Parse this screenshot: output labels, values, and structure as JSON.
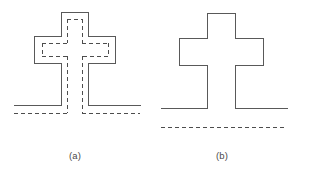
{
  "figure": {
    "background_color": "#ffffff",
    "solid_stroke_color": "#595959",
    "dashed_stroke_color": "#4d4d4d",
    "stroke_width": 1,
    "dash_pattern": "4 3",
    "width": 310,
    "height": 180
  },
  "panels": [
    {
      "id": "a",
      "caption": "(a)",
      "description": "Cross-shaped part outline with inner dashed offset contour and dashed datum lines",
      "solid_outline": {
        "name": "cross-outline-a",
        "points": "61,12 88,12 88,36 115,36 115,63 88,63 88,105 142,105 142,105 88,105 88,63 61,63 61,105 7,105 7,105 61,105 61,63 34,63 34,36 61,36 61,12",
        "closed": false
      },
      "solid_segments": [
        {
          "name": "cross-top-left-vertical",
          "x1": 61,
          "y1": 12,
          "x2": 61,
          "y2": 36
        },
        {
          "name": "cross-top-edge",
          "x1": 61,
          "y1": 12,
          "x2": 88,
          "y2": 12
        },
        {
          "name": "cross-top-right-vertical",
          "x1": 88,
          "y1": 12,
          "x2": 88,
          "y2": 36
        },
        {
          "name": "cross-upper-right-horizontal",
          "x1": 88,
          "y1": 36,
          "x2": 115,
          "y2": 36
        },
        {
          "name": "cross-right-arm-vertical",
          "x1": 115,
          "y1": 36,
          "x2": 115,
          "y2": 63
        },
        {
          "name": "cross-lower-right-horizontal",
          "x1": 115,
          "y1": 63,
          "x2": 88,
          "y2": 63
        },
        {
          "name": "cross-bottom-right-vertical",
          "x1": 88,
          "y1": 63,
          "x2": 88,
          "y2": 105
        },
        {
          "name": "cross-upper-left-horizontal",
          "x1": 61,
          "y1": 36,
          "x2": 34,
          "y2": 36
        },
        {
          "name": "cross-left-arm-vertical",
          "x1": 34,
          "y1": 36,
          "x2": 34,
          "y2": 63
        },
        {
          "name": "cross-lower-left-horizontal",
          "x1": 34,
          "y1": 63,
          "x2": 61,
          "y2": 63
        },
        {
          "name": "cross-bottom-left-vertical",
          "x1": 61,
          "y1": 63,
          "x2": 61,
          "y2": 105
        },
        {
          "name": "base-line-left",
          "x1": 14,
          "y1": 105,
          "x2": 61,
          "y2": 105
        },
        {
          "name": "base-line-right",
          "x1": 88,
          "y1": 105,
          "x2": 140,
          "y2": 105
        }
      ],
      "dashed_segments": [
        {
          "name": "offset-top-edge",
          "x1": 67,
          "y1": 19,
          "x2": 82,
          "y2": 19
        },
        {
          "name": "offset-top-left-vertical",
          "x1": 67,
          "y1": 19,
          "x2": 67,
          "y2": 43
        },
        {
          "name": "offset-top-right-vertical",
          "x1": 82,
          "y1": 19,
          "x2": 82,
          "y2": 43
        },
        {
          "name": "offset-upper-left-horizontal",
          "x1": 67,
          "y1": 43,
          "x2": 42,
          "y2": 43
        },
        {
          "name": "offset-left-arm-vertical",
          "x1": 42,
          "y1": 43,
          "x2": 42,
          "y2": 56
        },
        {
          "name": "offset-lower-left-horizontal",
          "x1": 42,
          "y1": 56,
          "x2": 67,
          "y2": 56
        },
        {
          "name": "offset-upper-right-horizontal",
          "x1": 82,
          "y1": 43,
          "x2": 108,
          "y2": 43
        },
        {
          "name": "offset-right-arm-vertical",
          "x1": 108,
          "y1": 43,
          "x2": 108,
          "y2": 56
        },
        {
          "name": "offset-lower-right-horizontal",
          "x1": 108,
          "y1": 56,
          "x2": 82,
          "y2": 56
        },
        {
          "name": "offset-stem-left-vertical",
          "x1": 67,
          "y1": 56,
          "x2": 67,
          "y2": 113
        },
        {
          "name": "offset-stem-right-vertical",
          "x1": 82,
          "y1": 56,
          "x2": 82,
          "y2": 113
        },
        {
          "name": "datum-line-left",
          "x1": 14,
          "y1": 113,
          "x2": 67,
          "y2": 113
        },
        {
          "name": "datum-line-right",
          "x1": 82,
          "y1": 113,
          "x2": 140,
          "y2": 113
        }
      ]
    },
    {
      "id": "b",
      "caption": "(b)",
      "description": "Plain cross-shaped part outline above a separated dashed datum line",
      "solid_segments": [
        {
          "name": "cross-top-left-vertical",
          "x1": 207,
          "y1": 13,
          "x2": 207,
          "y2": 38
        },
        {
          "name": "cross-top-edge",
          "x1": 207,
          "y1": 13,
          "x2": 235,
          "y2": 13
        },
        {
          "name": "cross-top-right-vertical",
          "x1": 235,
          "y1": 13,
          "x2": 235,
          "y2": 38
        },
        {
          "name": "cross-upper-right-horizontal",
          "x1": 235,
          "y1": 38,
          "x2": 263,
          "y2": 38
        },
        {
          "name": "cross-right-arm-vertical",
          "x1": 263,
          "y1": 38,
          "x2": 263,
          "y2": 65
        },
        {
          "name": "cross-lower-right-horizontal",
          "x1": 263,
          "y1": 65,
          "x2": 235,
          "y2": 65
        },
        {
          "name": "cross-bottom-right-vertical",
          "x1": 235,
          "y1": 65,
          "x2": 235,
          "y2": 108
        },
        {
          "name": "cross-upper-left-horizontal",
          "x1": 207,
          "y1": 38,
          "x2": 179,
          "y2": 38
        },
        {
          "name": "cross-left-arm-vertical",
          "x1": 179,
          "y1": 38,
          "x2": 179,
          "y2": 65
        },
        {
          "name": "cross-lower-left-horizontal",
          "x1": 179,
          "y1": 65,
          "x2": 207,
          "y2": 65
        },
        {
          "name": "cross-bottom-left-vertical",
          "x1": 207,
          "y1": 65,
          "x2": 207,
          "y2": 108
        },
        {
          "name": "base-line-left",
          "x1": 161,
          "y1": 108,
          "x2": 207,
          "y2": 108
        },
        {
          "name": "base-line-right",
          "x1": 235,
          "y1": 108,
          "x2": 287,
          "y2": 108
        }
      ],
      "dashed_segments": [
        {
          "name": "datum-line-full",
          "x1": 161,
          "y1": 127,
          "x2": 287,
          "y2": 127
        }
      ]
    }
  ]
}
